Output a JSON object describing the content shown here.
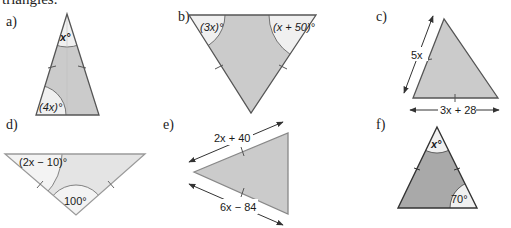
{
  "intro_text": "triangles.",
  "colors": {
    "fill_default": "#cbcbcb",
    "fill_light": "#e4e4e4",
    "fill_dark": "#a9a9a9",
    "angle_region": "#f0f0f0",
    "stroke": "#6e6e6e",
    "stroke_dark": "#444444"
  },
  "triangles": [
    {
      "id": "a",
      "label": "a)",
      "angles": [
        "x°",
        "(4x)°"
      ]
    },
    {
      "id": "b",
      "label": "b)",
      "angles": [
        "(3x)°",
        "(x + 50)°"
      ]
    },
    {
      "id": "c",
      "label": "c)",
      "sides": [
        "5x",
        "3x + 28"
      ]
    },
    {
      "id": "d",
      "label": "d)",
      "angles": [
        "(2x − 10)°",
        "100°"
      ]
    },
    {
      "id": "e",
      "label": "e)",
      "sides": [
        "2x + 40",
        "6x − 84"
      ]
    },
    {
      "id": "f",
      "label": "f)",
      "angles": [
        "x°",
        "70°"
      ]
    }
  ]
}
